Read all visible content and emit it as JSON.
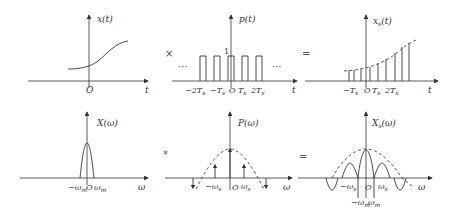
{
  "top_row": {
    "x_t": {
      "ylabel": "x(t)",
      "xlabel": "t",
      "origin": "O"
    },
    "op1": "×",
    "p_t": {
      "ylabel": "p(t)",
      "xlabel": "t",
      "origin": "O",
      "height_label": "1",
      "ellipsis_left": "···",
      "ellipsis_right": "···",
      "ticks": [
        "−2T",
        "−T",
        "T",
        "2T"
      ],
      "tick_sub": "s"
    },
    "op2": "=",
    "xs_t": {
      "ylabel_main": "x",
      "ylabel_sub": "s",
      "ylabel_tail": "(t)",
      "xlabel": "t",
      "origin": "O",
      "ticks": [
        "−T",
        "T",
        "2T"
      ],
      "tick_sub": "s"
    }
  },
  "bottom_row": {
    "X_w": {
      "ylabel": "X(ω)",
      "xlabel": "ω",
      "origin": "O",
      "ticks": [
        "−ω",
        "ω"
      ],
      "tick_sub": "m"
    },
    "op1": "*",
    "P_w": {
      "ylabel": "P(ω)",
      "xlabel": "ω",
      "origin": "O",
      "ticks": [
        "−ω",
        "ω"
      ],
      "tick_sub": "s"
    },
    "op2": "=",
    "Xs_w": {
      "ylabel_main": "X",
      "ylabel_sub": "s",
      "ylabel_tail": "(ω)",
      "xlabel": "ω",
      "origin": "O",
      "ticks": [
        "−ω",
        "ω"
      ],
      "tick_sub": "s",
      "bottom_ticks": [
        "−ω",
        "ω"
      ],
      "bottom_sub": "m"
    }
  }
}
